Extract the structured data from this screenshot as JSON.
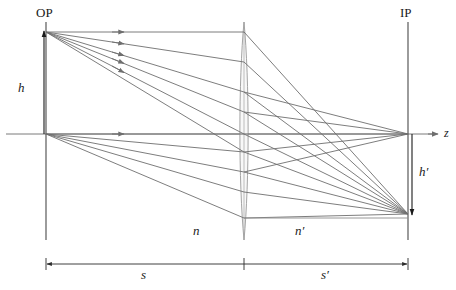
{
  "figure": {
    "kind": "optical-ray-diagram",
    "background_color": "#ffffff",
    "ray_color": "#6e6e6e",
    "structure_color": "#4a4a4a",
    "lens_color": "#9a9a9a",
    "text_color": "#1a1a1a"
  },
  "labels": {
    "object_plane": "OP",
    "image_plane": "IP",
    "object_height": "h",
    "image_height": "h′",
    "index_object_space": "n",
    "index_image_space": "n′",
    "object_distance": "s",
    "image_distance": "s′",
    "optical_axis": "z"
  },
  "geometry": {
    "axis_y": 134,
    "object_plane_x": 46,
    "lens_x": 244,
    "image_plane_x": 408,
    "object_top_y": 32,
    "image_bottom_y": 214,
    "lens_top_y": 22,
    "lens_bottom_y": 240,
    "dimension_line_y": 264,
    "secondary_line_y": 218,
    "axis_arrow_x": 437,
    "arrowhead_x": 123
  },
  "rays": {
    "from_object_top": [
      {
        "lens_y": 32
      },
      {
        "lens_y": 62
      },
      {
        "lens_y": 92
      },
      {
        "lens_y": 112
      },
      {
        "lens_y": 134
      }
    ],
    "from_axis_point": [
      {
        "lens_y": 134
      },
      {
        "lens_y": 152
      }
    ],
    "converge_top_to": {
      "x": 408,
      "y": 214
    },
    "converge_axis_to": {
      "x": 408,
      "y": 134
    }
  },
  "label_positions": {
    "object_plane": {
      "x": 36,
      "y": 6
    },
    "image_plane": {
      "x": 400,
      "y": 6
    },
    "object_height": {
      "x": 18,
      "y": 81
    },
    "image_height": {
      "x": 419,
      "y": 165
    },
    "index_object_space": {
      "x": 193,
      "y": 224
    },
    "index_image_space": {
      "x": 295,
      "y": 224
    },
    "object_distance": {
      "x": 141,
      "y": 268
    },
    "image_distance": {
      "x": 321,
      "y": 268
    },
    "optical_axis": {
      "x": 444,
      "y": 127
    }
  }
}
